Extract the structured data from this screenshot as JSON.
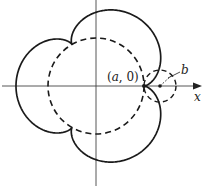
{
  "figure": {
    "type": "epicycloid",
    "origin_px": [
      96,
      86
    ],
    "a": 48,
    "b": 16,
    "cusps": 3,
    "colors": {
      "stroke": "#1a1a1a",
      "axis": "#444444",
      "background": "#ffffff"
    }
  },
  "labels": {
    "point_open": "(",
    "point_a": "a",
    "point_rest": ", 0)",
    "radius": "b",
    "x_axis": "x"
  }
}
